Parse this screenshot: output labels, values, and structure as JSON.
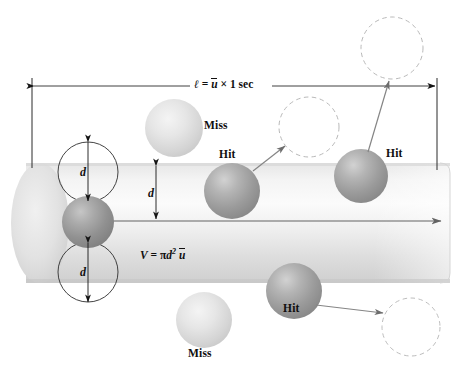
{
  "figure": {
    "length_label": {
      "symbol": "ℓ",
      "equals": "=",
      "speed": "u",
      "times": "×",
      "duration": "1 sec",
      "full_text": "ℓ = ū × 1 sec"
    },
    "volume_label": {
      "variable": "V",
      "equals": "=",
      "pi": "π",
      "diameter": "d",
      "exponent": "2",
      "speed": "u",
      "full_text": "V = πd² ū"
    },
    "diameter_labels": [
      {
        "id": "d-top",
        "text": "d"
      },
      {
        "id": "d-middle",
        "text": "d"
      },
      {
        "id": "d-bottom",
        "text": "d"
      }
    ],
    "outcome_labels": [
      {
        "id": "miss-upper",
        "text": "Miss"
      },
      {
        "id": "hit-left",
        "text": "Hit"
      },
      {
        "id": "hit-right",
        "text": "Hit"
      },
      {
        "id": "hit-lower",
        "text": "Hit"
      },
      {
        "id": "miss-lower",
        "text": "Miss"
      }
    ],
    "colors": {
      "ink": "#100f0f",
      "cylinder_light": "#f2f2f2",
      "cylinder_mid": "#dcdcdc",
      "cylinder_dark": "#c9c9c9",
      "sphere_hit": "#9a9a9a",
      "sphere_miss": "#d6d6d6",
      "sphere_origin": "#8d8d8d",
      "dashed_circle": "#b8b8b8",
      "arrow": "#6d6d6d",
      "dimension_line": "#2a2a2a"
    },
    "geometry": {
      "cylinder": {
        "x": 10,
        "y": 163,
        "width": 440,
        "height": 120
      },
      "axis_arrow": {
        "x1": 104,
        "y1": 221,
        "x2": 443,
        "y2": 221
      },
      "dimension_line": {
        "x1": 32,
        "y1": 86,
        "x2": 437,
        "y2": 86
      }
    }
  }
}
